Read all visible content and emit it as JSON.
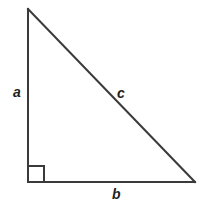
{
  "figure": {
    "type": "right-triangle-diagram",
    "background_color": "#ffffff",
    "stroke_color": "#3a3a3a",
    "label_color": "#231f20",
    "stroke_width": 2,
    "canvas": {
      "width": 209,
      "height": 207
    },
    "vertices": {
      "apex": {
        "x": 28,
        "y": 9
      },
      "bottom_left": {
        "x": 28,
        "y": 182
      },
      "bottom_right": {
        "x": 195,
        "y": 182
      }
    },
    "right_angle_marker": {
      "name": "right-angle-square",
      "x": 28,
      "y": 166,
      "size": 16,
      "at_vertex": "bottom_left"
    },
    "sides": [
      {
        "id": "a",
        "label": "a",
        "role": "vertical-leg",
        "from": "apex",
        "to": "bottom_left",
        "label_x": 13,
        "label_y": 85
      },
      {
        "id": "c",
        "label": "c",
        "role": "hypotenuse",
        "from": "apex",
        "to": "bottom_right",
        "label_x": 117,
        "label_y": 86
      },
      {
        "id": "b",
        "label": "b",
        "role": "horizontal-leg",
        "from": "bottom_left",
        "to": "bottom_right",
        "label_x": 112,
        "label_y": 187
      }
    ]
  }
}
